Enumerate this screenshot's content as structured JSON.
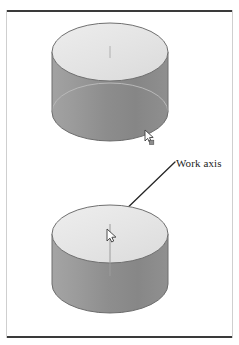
{
  "figure": {
    "title": "Work axis",
    "background_color": "#ffffff",
    "frame": {
      "rule_color": "#3a3a3a",
      "side_color": "#cfcfcf"
    },
    "annotations": [
      {
        "id": "work-axis-callout",
        "label": "Work axis",
        "leader_from": [
          176,
          163
        ],
        "leader_to": [
          119,
          215
        ],
        "color": "#1c1c1c"
      }
    ],
    "colors": {
      "top_face": "#e3e3e3",
      "top_face_highlight": "#efefef",
      "body_light": "#9a9a9a",
      "body_mid": "#8e8e8e",
      "body_dark": "#7c7c7c",
      "outline": "#555555",
      "hidden_edge": "#b5b5b5",
      "axis_line": "#9c9c9c",
      "cursor_fill": "#fbfbfb",
      "cursor_stroke": "#3c3c3c"
    },
    "objects": [
      {
        "id": "cylinder-top",
        "name": "cylinder-unselected",
        "center_x": 110,
        "top_ellipse_cy": 52,
        "rx": 58,
        "ry": 29,
        "height": 60,
        "axis_visible": true,
        "axis_length": 12,
        "cursor": {
          "x": 148,
          "y": 133,
          "badge": true
        }
      },
      {
        "id": "cylinder-bottom",
        "name": "cylinder-with-work-axis",
        "center_x": 110,
        "top_ellipse_cy": 234,
        "rx": 58,
        "ry": 29,
        "height": 50,
        "axis_visible": true,
        "axis_length": 52,
        "cursor": {
          "x": 110,
          "y": 232,
          "badge": false
        }
      }
    ]
  }
}
